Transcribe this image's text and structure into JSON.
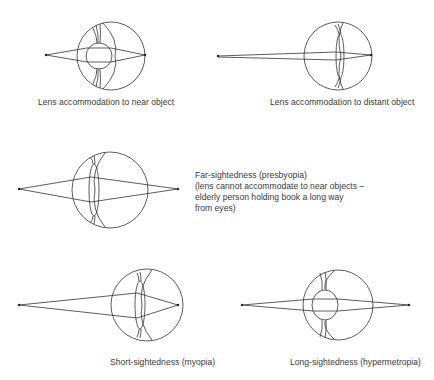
{
  "diagram": {
    "stroke_color": "#333333",
    "text_color": "#3a3a3a",
    "panels": [
      {
        "id": "near",
        "caption": "Lens accommodation to near object",
        "eyeball": {
          "cx": 111,
          "cy": 56,
          "r": 34
        },
        "lens": {
          "shape": "round",
          "cx": 99,
          "cy": 56,
          "rx": 13,
          "ry": 13
        },
        "object_point": [
          46,
          55
        ],
        "focus_point": [
          145,
          55
        ]
      },
      {
        "id": "distant",
        "caption": "Lens accommodation to distant object",
        "eyeball": {
          "cx": 338,
          "cy": 56,
          "r": 34
        },
        "lens": {
          "shape": "thin",
          "cx": 340,
          "cy": 56,
          "rx": 4,
          "ry": 22
        },
        "object_point": [
          218,
          56
        ],
        "focus_point": [
          371,
          55
        ]
      },
      {
        "id": "presbyopia",
        "caption_lines": [
          "Far-sightedness (presbyopia)",
          "(lens cannot accommodate to near objects –",
          "elderly person holding book a long way",
          "from eyes)"
        ],
        "eyeball": {
          "cx": 110,
          "cy": 190,
          "r": 38
        },
        "lens": {
          "shape": "thin",
          "cx": 94,
          "cy": 190,
          "rx": 5,
          "ry": 26
        },
        "object_point": [
          19,
          189
        ],
        "focus_point": [
          178,
          189
        ]
      },
      {
        "id": "myopia",
        "caption": "Short-sightedness (myopia)",
        "eyeball": {
          "cx": 147,
          "cy": 305,
          "r": 36
        },
        "lens": {
          "shape": "thin",
          "cx": 140,
          "cy": 305,
          "rx": 5,
          "ry": 24
        },
        "object_point": [
          19,
          305
        ],
        "focus_point": [
          178,
          305
        ]
      },
      {
        "id": "hypermetropia",
        "caption": "Long-sightedness (hypermetropia)",
        "eyeball": {
          "cx": 338,
          "cy": 305,
          "r": 35
        },
        "lens": {
          "shape": "round",
          "cx": 325,
          "cy": 305,
          "rx": 13,
          "ry": 15
        },
        "object_point": [
          242,
          305
        ],
        "focus_point": [
          409,
          305
        ]
      }
    ]
  }
}
